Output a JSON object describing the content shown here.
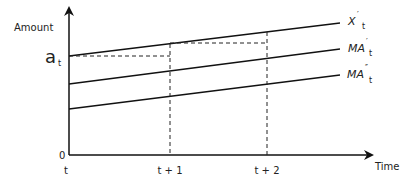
{
  "diagram": {
    "y_axis_label": "Amount",
    "x_axis_label": "Time",
    "origin_label": "0",
    "level_label": {
      "main": "a",
      "sub": "t"
    },
    "x_ticks": [
      "t",
      "t + 1",
      "t + 2"
    ],
    "series": [
      {
        "name": "X't",
        "main": "X",
        "prime": "′",
        "sub": "t"
      },
      {
        "name": "MA't",
        "main": "MA",
        "prime": "′",
        "sub": "t"
      },
      {
        "name": "MA''t",
        "main": "MA",
        "prime": "″",
        "sub": "t"
      }
    ],
    "colors": {
      "line": "#111111",
      "text": "#222222"
    }
  }
}
